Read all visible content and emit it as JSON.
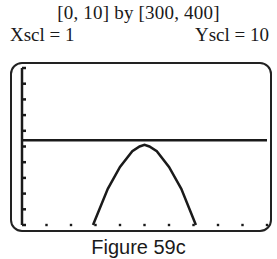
{
  "header": {
    "window": "[0, 10] by [300, 400]",
    "xscl": "Xscl = 1",
    "yscl": "Yscl = 10"
  },
  "caption": "Figure 59c",
  "colors": {
    "ink": "#1a1a1a",
    "background": "#ffffff"
  },
  "chart_data": {
    "type": "line",
    "title": "[0, 10] by [300, 400]",
    "xlabel": "",
    "ylabel": "",
    "xlim": [
      0,
      10
    ],
    "ylim": [
      300,
      400
    ],
    "xscl": 1,
    "yscl": 10,
    "grid": false,
    "series": [
      {
        "name": "parabola",
        "x": [
          2.9,
          3.5,
          4.0,
          4.5,
          4.8,
          5.0,
          5.2,
          5.5,
          6.0,
          6.5,
          7.1
        ],
        "y": [
          300,
          323,
          337,
          347,
          350,
          351,
          350,
          347,
          337,
          323,
          300
        ]
      },
      {
        "name": "horizontal line",
        "x": [
          0,
          10
        ],
        "y": [
          354,
          354
        ]
      }
    ],
    "annotations": [
      "Xscl = 1",
      "Yscl = 10"
    ]
  }
}
